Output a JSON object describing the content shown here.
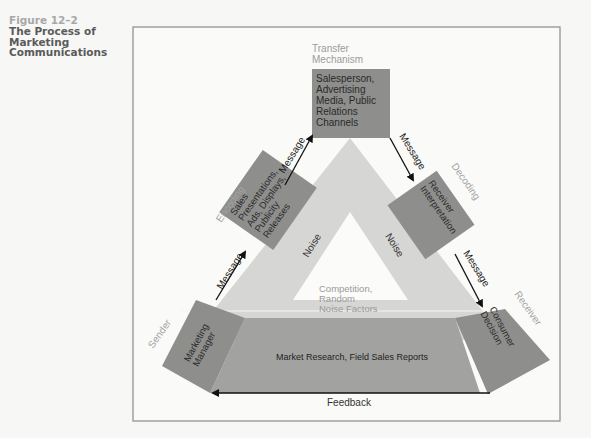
{
  "caption": {
    "figure_number": "Figure 12–2",
    "title_lines": [
      "The Process of",
      "Marketing",
      "Communications"
    ]
  },
  "diagram": {
    "stage_labels": {
      "transfer_1": "Transfer",
      "transfer_2": "Mechanism",
      "encoding": "Encoding",
      "decoding": "Decoding",
      "sender": "Sender",
      "receiver": "Receiver"
    },
    "boxes": {
      "transfer": [
        "Salesperson,",
        "Advertising",
        "Media, Public",
        "Relations",
        "Channels"
      ],
      "encoding": [
        "Sales",
        "Presentations,",
        "Ads, Displays,",
        "Publicity",
        "Releases"
      ],
      "decoding": [
        "Receiver",
        "Interpretation"
      ],
      "sender": [
        "Marketing",
        "Manager"
      ],
      "receiver": [
        "Consumer",
        "Decision"
      ]
    },
    "arrows": {
      "message_1": "Message",
      "message_2": "Message",
      "message_3": "Message",
      "message_4": "Message",
      "feedback": "Feedback"
    },
    "noise": {
      "left": "Noise",
      "right": "Noise",
      "center": [
        "Competition,",
        "Random",
        "Noise Factors"
      ]
    },
    "base_band": "Market Research, Field Sales Reports"
  },
  "colors": {
    "box_fill": "#8c8c8c",
    "band_fill": "#d3d3d3",
    "base_fill": "#9b9b9b",
    "light_label": "#a0a0a0",
    "frame": "#8a8a8a"
  }
}
